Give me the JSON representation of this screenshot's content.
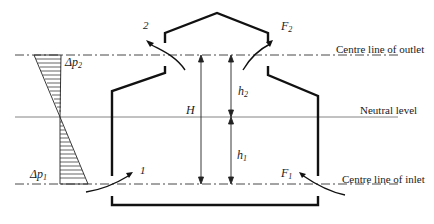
{
  "labels": {
    "outlet_line": "Centre line of outlet",
    "neutral_line": "Neutral level",
    "inlet_line": "Centre line of inlet",
    "height_total": "H",
    "h2_base": "h",
    "h2_sub": "2",
    "h1_base": "h",
    "h1_sub": "1",
    "dp2_base": "Δp",
    "dp2_sub": "2",
    "dp1_base": "Δp",
    "dp1_sub": "1",
    "opening_2": "2",
    "opening_1": "1",
    "F2_base": "F",
    "F2_sub": "2",
    "F1_base": "F",
    "F1_sub": "1"
  },
  "colors": {
    "stroke": "#1a1a1a",
    "thin_line": "#555555"
  }
}
